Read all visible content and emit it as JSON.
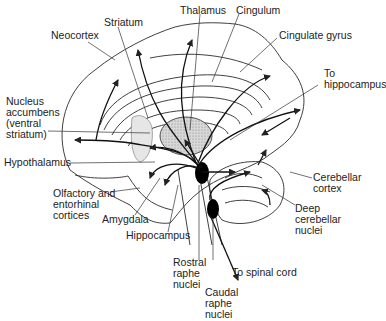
{
  "diagram": {
    "colors": {
      "line": "#2a2a2a",
      "fill_thalamus": "#cfcfcf",
      "nucleus": "#000000",
      "text": "#222222"
    },
    "labels": {
      "thalamus": "Thalamus",
      "cingulum": "Cingulum",
      "striatum": "Striatum",
      "neocortex": "Neocortex",
      "cingulate_gyrus": "Cingulate gyrus",
      "to_hippocampus": "To\nhippocampus",
      "nucleus_accumbens": "Nucleus\naccumbens\n(ventral\nstriatum)",
      "hypothalamus": "Hypothalamus",
      "olfactory": "Olfactory and\nentorhinal\ncortices",
      "amygdala": "Amygdala",
      "hippocampus": "Hippocampus",
      "cerebellar_cortex": "Cerebellar\ncortex",
      "deep_cerebellar_nuclei": "Deep\ncerebellar\nnuclei",
      "rostral_raphe_nuclei": "Rostral\nraphe\nnuclei",
      "to_spinal_cord": "To spinal cord",
      "caudal_raphe_nuclei": "Caudal\nraphe\nnuclei"
    }
  }
}
